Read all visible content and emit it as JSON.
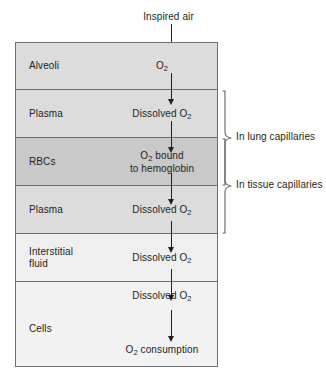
{
  "figure": {
    "inflow_label": "Inspired air",
    "outflow_label": "O2 consumption",
    "arrow_direction": "downward"
  },
  "colors": {
    "outline": "#6d6e71",
    "text": "#231f20",
    "background": "#ffffff",
    "fill_alveoli": "#dcdcdc",
    "fill_plasma": "#dcdcdc",
    "fill_rbcs": "#c9c9c9",
    "fill_interstitial": "#efefef",
    "fill_cells": "#f2f2f2"
  },
  "compartments": [
    {
      "id": "alveoli",
      "label": "Alveoli",
      "species_prefix": "O",
      "species_sub": "2",
      "species_suffix": "",
      "species_line2": "",
      "fill": "#dcdcdc"
    },
    {
      "id": "plasma-lung",
      "label": "Plasma",
      "species_prefix": "Dissolved O",
      "species_sub": "2",
      "species_suffix": "",
      "species_line2": "",
      "fill": "#dcdcdc"
    },
    {
      "id": "rbcs",
      "label": "RBCs",
      "species_prefix": "O",
      "species_sub": "2",
      "species_suffix": " bound",
      "species_line2": "to hemoglobin",
      "fill": "#c9c9c9"
    },
    {
      "id": "plasma-tissue",
      "label": "Plasma",
      "species_prefix": "Dissolved O",
      "species_sub": "2",
      "species_suffix": "",
      "species_line2": "",
      "fill": "#dcdcdc"
    },
    {
      "id": "interstitial-fluid",
      "label": "Interstitial\nfluid",
      "species_prefix": "Dissolved O",
      "species_sub": "2",
      "species_suffix": "",
      "species_line2": "",
      "fill": "#efefef"
    },
    {
      "id": "cells",
      "label": "Cells",
      "species_prefix": "Dissolved O",
      "species_sub": "2",
      "species_suffix": "",
      "species_line2": "",
      "consumption_prefix": "O",
      "consumption_sub": "2",
      "consumption_suffix": " consumption",
      "fill": "#f2f2f2"
    }
  ],
  "brackets": [
    {
      "id": "lung-capillaries",
      "label": "In lung capillaries",
      "spans": [
        "plasma-lung",
        "rbcs"
      ]
    },
    {
      "id": "tissue-capillaries",
      "label": "In tissue capillaries",
      "spans": [
        "rbcs",
        "plasma-tissue"
      ]
    }
  ]
}
